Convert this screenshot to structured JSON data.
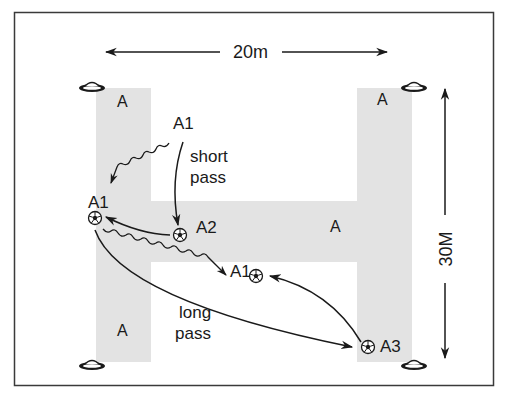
{
  "diagram": {
    "colors": {
      "frame": "#3a3a3a",
      "zone_fill": "#e3e3e3",
      "ink": "#1a1a1a",
      "background": "#ffffff"
    },
    "dimensions": {
      "width_label": "20m",
      "height_label": "30M"
    },
    "zones": [
      {
        "id": "left-bar-top",
        "label": "A"
      },
      {
        "id": "left-bar-bottom",
        "label": "A"
      },
      {
        "id": "right-bar-top",
        "label": "A"
      },
      {
        "id": "crossbar",
        "label": "A"
      }
    ],
    "players": [
      {
        "id": "a1-start",
        "label": "A1"
      },
      {
        "id": "a1-with-ball",
        "label": "A1"
      },
      {
        "id": "a2",
        "label": "A2"
      },
      {
        "id": "a1-run-end",
        "label": "A1"
      },
      {
        "id": "a3",
        "label": "A3"
      }
    ],
    "annotations": {
      "short_pass_line1": "short",
      "short_pass_line2": "pass",
      "long_pass_line1": "long",
      "long_pass_line2": "pass"
    },
    "cones": [
      "top-left",
      "top-right",
      "bottom-left",
      "bottom-right"
    ]
  }
}
